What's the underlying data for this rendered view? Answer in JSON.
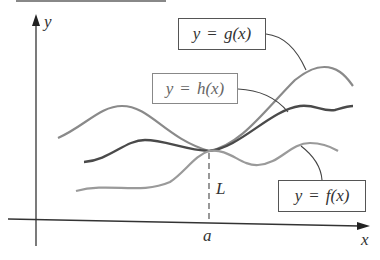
{
  "diagram": {
    "axes": {
      "x_label": "x",
      "y_label": "y"
    },
    "point": {
      "x_label": "a",
      "y_label": "L"
    },
    "labels": {
      "g": {
        "lhs": "y",
        "eq": "=",
        "rhs": "g(x)"
      },
      "h": {
        "lhs": "y",
        "eq": "=",
        "rhs": "h(x)"
      },
      "f": {
        "lhs": "y",
        "eq": "=",
        "rhs": "f(x)"
      }
    },
    "colors": {
      "axis": "#333333",
      "g_curve": "#8a8a8a",
      "h_curve": "#4a4a4a",
      "f_curve": "#9a9a9a",
      "leader": "#444444",
      "box_border": "#555555"
    }
  }
}
